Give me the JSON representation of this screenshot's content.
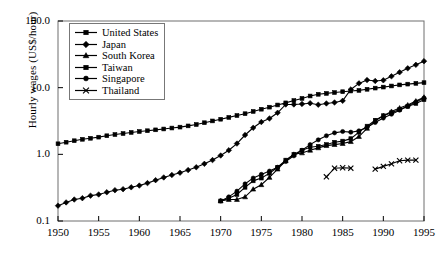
{
  "chart_data": {
    "type": "line",
    "title": "",
    "xlabel": "",
    "ylabel": "Hourly wages (US$/hour)",
    "yscale": "log",
    "ylim": [
      0.1,
      100.0
    ],
    "xlim": [
      1950,
      1995
    ],
    "grid": false,
    "legend_position": "top-left-inside",
    "ytick_labels": [
      "100.0",
      "10.0",
      "1.0",
      "0.1"
    ],
    "ytick_values": [
      100.0,
      10.0,
      1.0,
      0.1
    ],
    "xtick_labels": [
      "1950",
      "1955",
      "1960",
      "1965",
      "1970",
      "1975",
      "1980",
      "1985",
      "1990",
      "1995"
    ],
    "xtick_values": [
      1950,
      1955,
      1960,
      1965,
      1970,
      1975,
      1980,
      1985,
      1990,
      1995
    ],
    "series": [
      {
        "name": "United States",
        "marker": "square",
        "x": [
          1950,
          1951,
          1952,
          1953,
          1954,
          1955,
          1956,
          1957,
          1958,
          1959,
          1960,
          1961,
          1962,
          1963,
          1964,
          1965,
          1966,
          1967,
          1968,
          1969,
          1970,
          1971,
          1972,
          1973,
          1974,
          1975,
          1976,
          1977,
          1978,
          1979,
          1980,
          1981,
          1982,
          1983,
          1984,
          1985,
          1986,
          1987,
          1988,
          1989,
          1990,
          1991,
          1992,
          1993,
          1994,
          1995
        ],
        "y": [
          1.44,
          1.52,
          1.6,
          1.68,
          1.74,
          1.81,
          1.9,
          1.98,
          2.05,
          2.13,
          2.2,
          2.26,
          2.33,
          2.4,
          2.48,
          2.56,
          2.67,
          2.8,
          2.98,
          3.17,
          3.36,
          3.58,
          3.82,
          4.07,
          4.4,
          4.75,
          5.1,
          5.5,
          5.92,
          6.4,
          6.9,
          7.5,
          7.95,
          8.2,
          8.45,
          8.7,
          8.9,
          9.1,
          9.45,
          9.85,
          10.2,
          10.6,
          11.0,
          11.3,
          11.6,
          11.9
        ]
      },
      {
        "name": "Japan",
        "marker": "diamond",
        "x": [
          1950,
          1951,
          1952,
          1953,
          1954,
          1955,
          1956,
          1957,
          1958,
          1959,
          1960,
          1961,
          1962,
          1963,
          1964,
          1965,
          1966,
          1967,
          1968,
          1969,
          1970,
          1971,
          1972,
          1973,
          1974,
          1975,
          1976,
          1977,
          1978,
          1979,
          1980,
          1981,
          1982,
          1983,
          1984,
          1985,
          1986,
          1987,
          1988,
          1989,
          1990,
          1991,
          1992,
          1993,
          1994,
          1995
        ],
        "y": [
          0.17,
          0.19,
          0.21,
          0.22,
          0.24,
          0.25,
          0.27,
          0.29,
          0.3,
          0.32,
          0.34,
          0.37,
          0.41,
          0.45,
          0.49,
          0.53,
          0.58,
          0.64,
          0.72,
          0.82,
          0.96,
          1.15,
          1.45,
          1.95,
          2.5,
          3.05,
          3.45,
          4.2,
          5.6,
          5.6,
          5.7,
          5.85,
          5.55,
          5.8,
          6.0,
          6.35,
          9.4,
          11.6,
          13.0,
          12.6,
          12.9,
          14.8,
          17.0,
          19.5,
          22.0,
          25.0
        ]
      },
      {
        "name": "South Korea",
        "marker": "triangle",
        "x": [
          1970,
          1971,
          1972,
          1973,
          1974,
          1975,
          1976,
          1977,
          1978,
          1979,
          1980,
          1981,
          1982,
          1983,
          1984,
          1985,
          1986,
          1987,
          1988,
          1989,
          1990,
          1991,
          1992,
          1993,
          1994,
          1995
        ],
        "y": [
          0.2,
          0.21,
          0.21,
          0.23,
          0.3,
          0.35,
          0.45,
          0.6,
          0.8,
          1.0,
          1.05,
          1.15,
          1.25,
          1.35,
          1.4,
          1.45,
          1.55,
          1.85,
          2.45,
          3.2,
          3.8,
          4.4,
          4.95,
          5.5,
          6.3,
          7.2
        ]
      },
      {
        "name": "Taiwan",
        "marker": "square",
        "x": [
          1970,
          1971,
          1972,
          1973,
          1974,
          1975,
          1976,
          1977,
          1978,
          1979,
          1980,
          1981,
          1982,
          1983,
          1984,
          1985,
          1986,
          1987,
          1988,
          1989,
          1990,
          1991,
          1992,
          1993,
          1994,
          1995
        ],
        "y": [
          0.2,
          0.22,
          0.25,
          0.32,
          0.4,
          0.44,
          0.52,
          0.64,
          0.82,
          1.0,
          1.15,
          1.28,
          1.32,
          1.4,
          1.52,
          1.58,
          1.72,
          2.15,
          2.65,
          3.25,
          3.8,
          4.2,
          4.7,
          5.2,
          5.8,
          6.6
        ]
      },
      {
        "name": "Singapore",
        "marker": "circle",
        "x": [
          1970,
          1971,
          1972,
          1973,
          1974,
          1975,
          1976,
          1977,
          1978,
          1979,
          1980,
          1981,
          1982,
          1983,
          1984,
          1985,
          1986,
          1987,
          1988,
          1989,
          1990,
          1991,
          1992,
          1993,
          1994,
          1995
        ],
        "y": [
          0.2,
          0.23,
          0.28,
          0.36,
          0.44,
          0.5,
          0.56,
          0.64,
          0.78,
          0.95,
          1.15,
          1.4,
          1.65,
          1.9,
          2.1,
          2.2,
          2.15,
          2.25,
          2.55,
          3.0,
          3.5,
          4.0,
          4.6,
          5.3,
          6.1,
          7.0
        ]
      },
      {
        "name": "Thailand",
        "marker": "cross",
        "segments": [
          {
            "x": [
              1983,
              1984,
              1985,
              1986
            ],
            "y": [
              0.46,
              0.62,
              0.63,
              0.62
            ]
          },
          {
            "x": [
              1989,
              1990,
              1991,
              1992,
              1993,
              1994
            ],
            "y": [
              0.6,
              0.66,
              0.72,
              0.8,
              0.82,
              0.82
            ]
          }
        ]
      }
    ]
  },
  "axes": {
    "y_label": "Hourly wages (US$/hour)",
    "y_ticks": [
      "100.0",
      "10.0",
      "1.0",
      "0.1"
    ],
    "x_ticks": [
      "1950",
      "1955",
      "1960",
      "1965",
      "1970",
      "1975",
      "1980",
      "1985",
      "1990",
      "1995"
    ]
  },
  "legend": {
    "items": [
      {
        "label": "United States",
        "marker": "square-marker"
      },
      {
        "label": "Japan",
        "marker": "diamond-marker"
      },
      {
        "label": "South Korea",
        "marker": "triangle-marker"
      },
      {
        "label": "Taiwan",
        "marker": "square-marker"
      },
      {
        "label": "Singapore",
        "marker": "circle-marker"
      },
      {
        "label": "Thailand",
        "marker": "cross-marker"
      }
    ]
  },
  "colors": {
    "ink": "#000000",
    "frame": "#6e6e6e",
    "background": "#ffffff"
  }
}
